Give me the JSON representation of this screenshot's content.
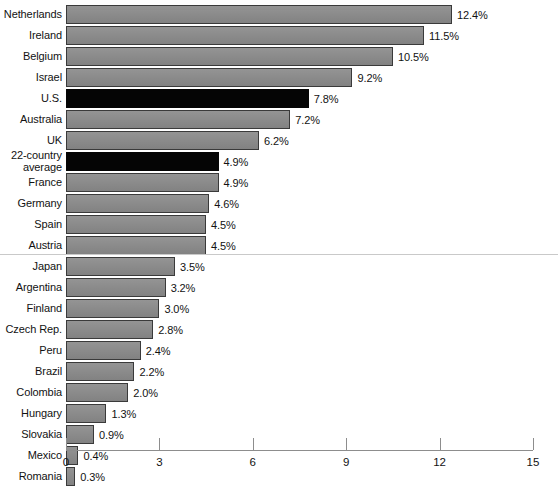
{
  "chart_data": {
    "type": "bar",
    "orientation": "horizontal",
    "title": "",
    "subtitle": "",
    "xlabel": "",
    "ylabel": "",
    "xlim": [
      0,
      15
    ],
    "xticks": [
      0,
      3,
      6,
      9,
      12,
      15
    ],
    "xtick_labels": [
      "0",
      "3",
      "6",
      "9",
      "12",
      "15"
    ],
    "grid": false,
    "legend": null,
    "value_suffix": "%",
    "group_divider_after": "Austria",
    "colors": {
      "bar": "#8e8e8e",
      "bar_border": "#3a3a3a",
      "highlight_bar": "#050505",
      "axis": "#8d8d8d",
      "text": "#121212",
      "divider": "#c9c9c9",
      "background": "#ffffff"
    },
    "categories": [
      "Netherlands",
      "Ireland",
      "Belgium",
      "Israel",
      "U.S.",
      "Australia",
      "UK",
      "22-country\naverage",
      "France",
      "Germany",
      "Spain",
      "Austria",
      "Japan",
      "Argentina",
      "Finland",
      "Czech Rep.",
      "Peru",
      "Brazil",
      "Colombia",
      "Hungary",
      "Slovakia",
      "Mexico",
      "Romania"
    ],
    "values": [
      12.4,
      11.5,
      10.5,
      9.2,
      7.8,
      7.2,
      6.2,
      4.9,
      4.9,
      4.6,
      4.5,
      4.5,
      3.5,
      3.2,
      3.0,
      2.8,
      2.4,
      2.2,
      2.0,
      1.3,
      0.9,
      0.4,
      0.3
    ],
    "value_labels": [
      "12.4%",
      "11.5%",
      "10.5%",
      "9.2%",
      "7.8%",
      "7.2%",
      "6.2%",
      "4.9%",
      "4.9%",
      "4.6%",
      "4.5%",
      "4.5%",
      "3.5%",
      "3.2%",
      "3.0%",
      "2.8%",
      "2.4%",
      "2.2%",
      "2.0%",
      "1.3%",
      "0.9%",
      "0.4%",
      "0.3%"
    ],
    "highlighted": [
      "U.S.",
      "22-country\naverage"
    ],
    "bars": [
      {
        "label": "Netherlands",
        "value": 12.4,
        "value_label": "12.4%",
        "highlight": false
      },
      {
        "label": "Ireland",
        "value": 11.5,
        "value_label": "11.5%",
        "highlight": false
      },
      {
        "label": "Belgium",
        "value": 10.5,
        "value_label": "10.5%",
        "highlight": false
      },
      {
        "label": "Israel",
        "value": 9.2,
        "value_label": "9.2%",
        "highlight": false
      },
      {
        "label": "U.S.",
        "value": 7.8,
        "value_label": "7.8%",
        "highlight": true
      },
      {
        "label": "Australia",
        "value": 7.2,
        "value_label": "7.2%",
        "highlight": false
      },
      {
        "label": "UK",
        "value": 6.2,
        "value_label": "6.2%",
        "highlight": false
      },
      {
        "label": "22-country\naverage",
        "value": 4.9,
        "value_label": "4.9%",
        "highlight": true
      },
      {
        "label": "France",
        "value": 4.9,
        "value_label": "4.9%",
        "highlight": false
      },
      {
        "label": "Germany",
        "value": 4.6,
        "value_label": "4.6%",
        "highlight": false
      },
      {
        "label": "Spain",
        "value": 4.5,
        "value_label": "4.5%",
        "highlight": false
      },
      {
        "label": "Austria",
        "value": 4.5,
        "value_label": "4.5%",
        "highlight": false
      },
      {
        "label": "Japan",
        "value": 3.5,
        "value_label": "3.5%",
        "highlight": false
      },
      {
        "label": "Argentina",
        "value": 3.2,
        "value_label": "3.2%",
        "highlight": false
      },
      {
        "label": "Finland",
        "value": 3.0,
        "value_label": "3.0%",
        "highlight": false
      },
      {
        "label": "Czech Rep.",
        "value": 2.8,
        "value_label": "2.8%",
        "highlight": false
      },
      {
        "label": "Peru",
        "value": 2.4,
        "value_label": "2.4%",
        "highlight": false
      },
      {
        "label": "Brazil",
        "value": 2.2,
        "value_label": "2.2%",
        "highlight": false
      },
      {
        "label": "Colombia",
        "value": 2.0,
        "value_label": "2.0%",
        "highlight": false
      },
      {
        "label": "Hungary",
        "value": 1.3,
        "value_label": "1.3%",
        "highlight": false
      },
      {
        "label": "Slovakia",
        "value": 0.9,
        "value_label": "0.9%",
        "highlight": false
      },
      {
        "label": "Mexico",
        "value": 0.4,
        "value_label": "0.4%",
        "highlight": false
      },
      {
        "label": "Romania",
        "value": 0.3,
        "value_label": "0.3%",
        "highlight": false
      }
    ]
  }
}
